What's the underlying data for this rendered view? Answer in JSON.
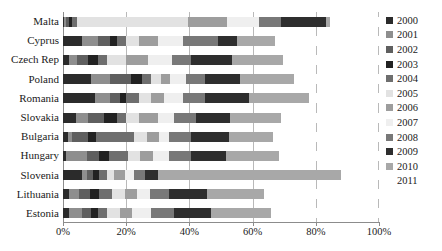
{
  "chart_data": {
    "type": "bar",
    "subtype": "stacked-horizontal-100-percent",
    "title": "",
    "xlabel": "",
    "ylabel": "",
    "xlim": [
      0,
      100
    ],
    "xticks": [
      0,
      20,
      40,
      60,
      80,
      100
    ],
    "xticklabels": [
      "0%",
      "20%",
      "40%",
      "60%",
      "80%",
      "100%"
    ],
    "grid": true,
    "grid_axis": "x",
    "legend_position": "right",
    "categories": [
      "Malta",
      "Cyprus",
      "Czech Rep",
      "Poland",
      "Romania",
      "Slovakia",
      "Bulgaria",
      "Hungary",
      "Slovenia",
      "Lithuania",
      "Estonia"
    ],
    "series": [
      {
        "name": "2000",
        "color": "#2b2b2b",
        "values": [
          0.4,
          6.0,
          2.0,
          9.0,
          10.0,
          4.0,
          1.5,
          1.0,
          6.0,
          2.0,
          2.0
        ]
      },
      {
        "name": "2001",
        "color": "#8e8e8e",
        "values": [
          0.6,
          5.0,
          2.5,
          6.0,
          5.0,
          4.0,
          1.5,
          6.5,
          1.5,
          3.0,
          4.0
        ]
      },
      {
        "name": "2002",
        "color": "#5f5f5f",
        "values": [
          0.8,
          4.0,
          3.5,
          6.5,
          3.0,
          5.0,
          5.0,
          4.0,
          2.0,
          3.5,
          3.0
        ]
      },
      {
        "name": "2003",
        "color": "#222222",
        "values": [
          1.0,
          2.0,
          3.0,
          3.5,
          2.0,
          4.0,
          2.5,
          3.0,
          2.0,
          3.0,
          2.0
        ]
      },
      {
        "name": "2004",
        "color": "#6e6e6e",
        "values": [
          1.5,
          3.0,
          3.0,
          3.0,
          4.0,
          3.0,
          12.0,
          6.0,
          2.5,
          4.0,
          3.0
        ]
      },
      {
        "name": "2005",
        "color": "#e2e2e2",
        "values": [
          35.0,
          4.0,
          6.0,
          3.0,
          4.0,
          4.0,
          4.0,
          4.0,
          2.0,
          4.0,
          4.0
        ]
      },
      {
        "name": "2006",
        "color": "#9d9d9d",
        "values": [
          12.0,
          6.0,
          7.0,
          3.0,
          4.0,
          6.0,
          4.0,
          4.0,
          3.5,
          4.0,
          4.0
        ]
      },
      {
        "name": "2007",
        "color": "#efefef",
        "values": [
          10.0,
          8.0,
          7.5,
          5.0,
          6.0,
          5.0,
          3.0,
          5.0,
          3.0,
          4.0,
          6.0
        ]
      },
      {
        "name": "2008",
        "color": "#787878",
        "values": [
          7.0,
          11.0,
          6.0,
          6.0,
          7.0,
          7.0,
          7.0,
          7.0,
          3.5,
          6.0,
          7.0
        ]
      },
      {
        "name": "2009",
        "color": "#2e2e2e",
        "values": [
          14.0,
          6.0,
          13.0,
          11.0,
          14.0,
          11.0,
          12.0,
          11.0,
          4.0,
          12.0,
          12.0
        ]
      },
      {
        "name": "2010",
        "color": "#a8a8a8",
        "values": [
          1.5,
          12.0,
          16.0,
          17.0,
          19.0,
          16.0,
          14.0,
          17.0,
          58.0,
          18.0,
          19.0
        ]
      },
      {
        "name": "2011",
        "color": "#ffffff",
        "values": [
          15.2,
          33.0,
          30.5,
          27.0,
          22.0,
          31.0,
          33.5,
          31.5,
          12.0,
          36.5,
          34.0
        ]
      }
    ]
  },
  "legend": {
    "items": [
      {
        "label": "2000"
      },
      {
        "label": "2001"
      },
      {
        "label": "2002"
      },
      {
        "label": "2003"
      },
      {
        "label": "2004"
      },
      {
        "label": "2005"
      },
      {
        "label": "2006"
      },
      {
        "label": "2007"
      },
      {
        "label": "2008"
      },
      {
        "label": "2009"
      },
      {
        "label": "2010"
      },
      {
        "label": "2011"
      }
    ]
  }
}
